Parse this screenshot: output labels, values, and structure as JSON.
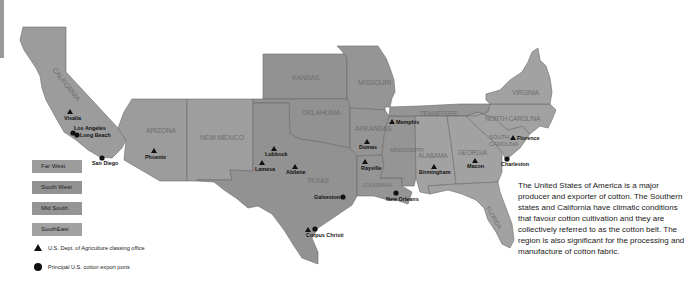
{
  "map": {
    "title": "",
    "states": [
      {
        "name": "CALIFORNIA",
        "region": "Far West"
      },
      {
        "name": "ARIZONA",
        "region": "Far West"
      },
      {
        "name": "NEW MEXICO",
        "region": "South West"
      },
      {
        "name": "KANSAS",
        "region": "South West"
      },
      {
        "name": "OKLAHOMA",
        "region": "South West"
      },
      {
        "name": "TEXAS",
        "region": "South West"
      },
      {
        "name": "MISSOURI",
        "region": "Mid South"
      },
      {
        "name": "ARKANSAS",
        "region": "Mid South"
      },
      {
        "name": "LOUISIANA",
        "region": "Mid South"
      },
      {
        "name": "MISSISSIPPI",
        "region": "Mid South"
      },
      {
        "name": "TENNESSEE",
        "region": "Mid South"
      },
      {
        "name": "ALABAMA",
        "region": "SouthEast"
      },
      {
        "name": "GEORGIA",
        "region": "SouthEast"
      },
      {
        "name": "FLORIDA",
        "region": "SouthEast"
      },
      {
        "name": "SOUTH CAROLINA",
        "region": "SouthEast"
      },
      {
        "name": "NORTH CAROLINA",
        "region": "SouthEast"
      },
      {
        "name": "VIRGINIA",
        "region": "SouthEast"
      }
    ],
    "state_labels": {
      "california": "CALIFORNIA",
      "arizona": "ARIZONA",
      "new_mexico": "NEW MEXICO",
      "kansas": "KANSAS",
      "oklahoma": "OKLAHOMA",
      "texas": "TEXAS",
      "missouri": "MISSOURI",
      "arkansas": "ARKANSAS",
      "louisiana": "LOUISIANA",
      "mississippi": "MISSISSIPPI",
      "tennessee": "TENNESSEE",
      "alabama": "ALABAMA",
      "georgia": "GEORGIA",
      "florida": "FLORIDA",
      "south_carolina_1": "SOUTH",
      "south_carolina_2": "CAROLINA",
      "north_carolina": "NORTH CAROLINA",
      "virginia": "VIRGINIA"
    },
    "cities": {
      "visalia": {
        "label": "Visalia",
        "type": "classing-office"
      },
      "los_angeles": {
        "label": "Los Angeles",
        "type": "export-port"
      },
      "long_beach": {
        "label": "Long Beach",
        "type": "export-port"
      },
      "san_diego": {
        "label": "San Diego",
        "type": "export-port"
      },
      "phoenix": {
        "label": "Phoenix",
        "type": "classing-office"
      },
      "lubbock": {
        "label": "Lubbock",
        "type": "classing-office"
      },
      "lamesa": {
        "label": "Lamesa",
        "type": "classing-office"
      },
      "abilene": {
        "label": "Abilene",
        "type": "classing-office"
      },
      "galveston": {
        "label": "Galveston",
        "type": "export-port"
      },
      "corpus_christi": {
        "label": "Corpus Christi",
        "type": "both"
      },
      "dumas": {
        "label": "Dumas",
        "type": "classing-office"
      },
      "rayville": {
        "label": "Rayville",
        "type": "classing-office"
      },
      "memphis": {
        "label": "Memphis",
        "type": "classing-office"
      },
      "new_orleans": {
        "label": "New Orleans",
        "type": "export-port"
      },
      "birmingham": {
        "label": "Birmingham",
        "type": "classing-office"
      },
      "macon": {
        "label": "Macon",
        "type": "classing-office"
      },
      "charleston": {
        "label": "Charleston",
        "type": "export-port"
      },
      "florence": {
        "label": "Florence",
        "type": "classing-office"
      }
    },
    "colors": {
      "far_west": "#9c9c9c",
      "south_west": "#929292",
      "mid_south": "#959595",
      "south_east": "#a2a2a2",
      "border": "#6a6a6a",
      "marker": "#111111"
    }
  },
  "legend": {
    "regions": [
      "Far West",
      "South West",
      "Mid South",
      "SouthEast"
    ],
    "symbols": {
      "triangle": "U.S. Dept. of Agriculture classing office",
      "circle": "Principal U.S. cotton export ports"
    }
  },
  "description": "The United States of America is a major producer and exporter of cotton. The Southern states and California have climatic conditions that favour cotton cultivation and they are collectively referred to as the cotton belt. The region is also significant for the processing and manufacture of cotton fabric."
}
